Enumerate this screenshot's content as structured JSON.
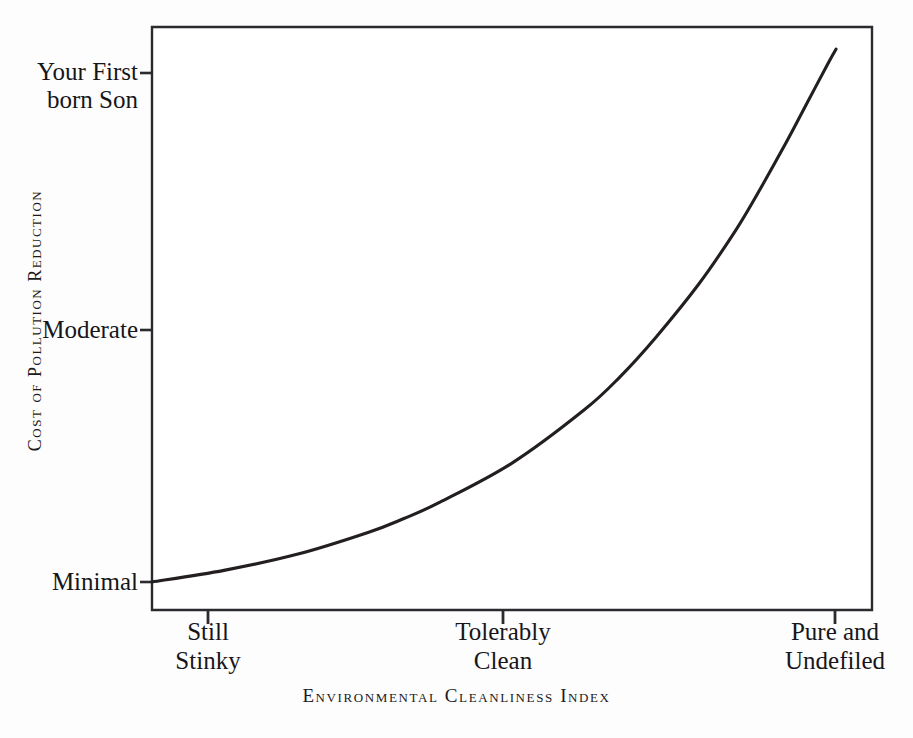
{
  "chart_data": {
    "type": "line",
    "title": "",
    "xlabel": "Environmental Cleanliness Index",
    "ylabel": "Cost of Pollution Reduction",
    "grid": false,
    "legend": "none",
    "line_color": "#231f20",
    "frame_color": "#2b2b2f",
    "background": "#ffffff",
    "x_categories": [
      "Still\nStinky",
      "Tolerably\nClean",
      "Pure and\nUndefiled"
    ],
    "y_categories": [
      "Your First\nborn Son",
      "Moderate",
      "Minimal"
    ],
    "xlim": [
      0,
      1
    ],
    "ylim": [
      0,
      1
    ],
    "x_tick_positions": [
      0.078,
      0.488,
      0.949
    ],
    "y_tick_positions": [
      0.873,
      0.433,
      0.048
    ],
    "series": [
      {
        "name": "Cost of pollution reduction",
        "x": [
          0.0,
          0.1,
          0.2,
          0.3,
          0.35,
          0.4,
          0.5,
          0.6,
          0.65,
          0.7,
          0.76,
          0.81,
          0.84,
          0.88,
          0.91,
          0.94,
          0.95
        ],
        "y": [
          0.048,
          0.068,
          0.095,
          0.133,
          0.157,
          0.185,
          0.252,
          0.343,
          0.4,
          0.468,
          0.56,
          0.65,
          0.712,
          0.8,
          0.87,
          0.94,
          0.962
        ]
      }
    ]
  },
  "axes": {
    "y_ticks": [
      {
        "label": "Your First\nborn Son"
      },
      {
        "label": "Moderate"
      },
      {
        "label": "Minimal"
      }
    ],
    "x_ticks": [
      {
        "label": "Still\nStinky"
      },
      {
        "label": "Tolerably\nClean"
      },
      {
        "label": "Pure and\nUndefiled"
      }
    ],
    "x_title": "Environmental Cleanliness Index",
    "y_title": "Cost of Pollution Reduction"
  }
}
